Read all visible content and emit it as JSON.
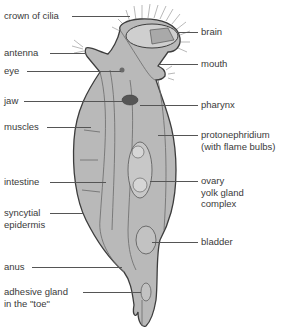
{
  "diagram": {
    "colors": {
      "body_fill": "#b9b9b9",
      "body_stroke": "#3d3d3d",
      "inner_stroke": "#6a6a6a",
      "label_text": "#3a3a3a",
      "leader_line": "#555555"
    },
    "labels_left": [
      {
        "id": "crown-of-cilia",
        "text": "crown of cilia"
      },
      {
        "id": "antenna",
        "text": "antenna"
      },
      {
        "id": "eye",
        "text": "eye"
      },
      {
        "id": "jaw",
        "text": "jaw"
      },
      {
        "id": "muscles",
        "text": "muscles"
      },
      {
        "id": "intestine",
        "text": "intestine"
      },
      {
        "id": "syncytial-epidermis",
        "text": "syncytial\nepidermis"
      },
      {
        "id": "anus",
        "text": "anus"
      },
      {
        "id": "adhesive-gland",
        "text": "adhesive gland\nin the \"toe\""
      }
    ],
    "labels_right": [
      {
        "id": "brain",
        "text": "brain"
      },
      {
        "id": "mouth",
        "text": "mouth"
      },
      {
        "id": "pharynx",
        "text": "pharynx"
      },
      {
        "id": "protonephridium",
        "text": "protonephridium\n(with flame bulbs)"
      },
      {
        "id": "ovary-yolk-gland-complex",
        "text": "ovary\nyolk gland\ncomplex"
      },
      {
        "id": "bladder",
        "text": "bladder"
      }
    ]
  }
}
